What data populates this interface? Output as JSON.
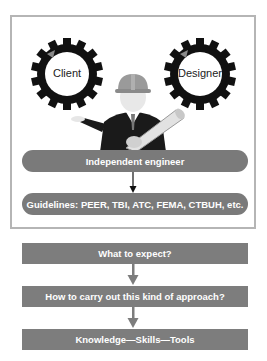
{
  "diagram": {
    "top_panel": {
      "gears": [
        {
          "label": "Client"
        },
        {
          "label": "Designer"
        }
      ],
      "figure": "engineer-with-hard-hat-holding-blueprint",
      "engineer_pill": {
        "label": "Independent engineer"
      },
      "guidelines_pill": {
        "label": "Guidelines: PEER, TBI, ATC, FEMA, CTBUH, etc."
      }
    },
    "flow": [
      {
        "label": "What to expect?"
      },
      {
        "label": "How to carry out this kind of approach?"
      },
      {
        "label": "Knowledge—Skills—Tools"
      }
    ],
    "colors": {
      "pill_fill": "#7a7a7a",
      "box_fill": "#7d7d7d",
      "frame_border": "#b5b5b5",
      "gear": "#111111",
      "text_light": "#ffffff"
    }
  }
}
